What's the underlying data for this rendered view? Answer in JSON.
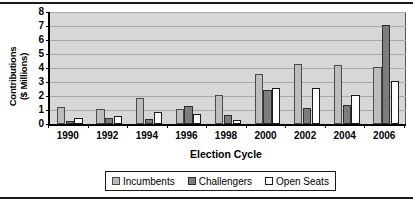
{
  "chart_data": {
    "type": "bar",
    "title": "",
    "xlabel": "Election Cycle",
    "ylabel": "Contributions ($ Millions)",
    "ylabel_lines": [
      "Contributions",
      "($ Millions)"
    ],
    "categories": [
      "1990",
      "1992",
      "1994",
      "1996",
      "1998",
      "2000",
      "2002",
      "2004",
      "2006"
    ],
    "yticks": [
      "0",
      "1",
      "2",
      "3",
      "4",
      "5",
      "6",
      "7",
      "8"
    ],
    "ylim": [
      0,
      8
    ],
    "grid": true,
    "legend_position": "bottom",
    "series": [
      {
        "name": "Incumbents",
        "color": "#bdbdbd",
        "values": [
          1.25,
          1.05,
          1.85,
          1.05,
          2.1,
          3.6,
          4.3,
          4.2,
          4.05
        ]
      },
      {
        "name": "Challengers",
        "color": "#7d7d7d",
        "values": [
          0.25,
          0.45,
          0.35,
          1.3,
          0.65,
          2.4,
          1.15,
          1.35,
          7.1
        ]
      },
      {
        "name": "Open Seats",
        "color": "#ffffff",
        "values": [
          0.45,
          0.55,
          0.85,
          0.75,
          0.3,
          2.55,
          2.6,
          2.05,
          3.05
        ]
      }
    ]
  }
}
